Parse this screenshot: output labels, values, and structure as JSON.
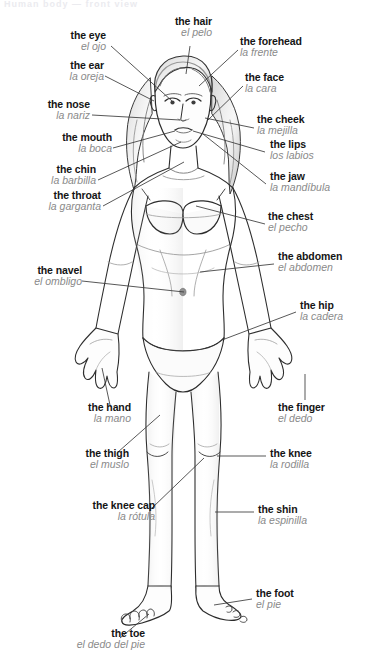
{
  "page": {
    "title_cut": "Human body — front view",
    "background_color": "#ffffff",
    "english_color": "#151515",
    "spanish_color": "#8a8a8a",
    "leader_color": "#3a3a3a"
  },
  "figure": {
    "name": "female-body-front-view",
    "style": "pencil sketch line drawing"
  },
  "labels": [
    {
      "id": "eye",
      "en": "the eye",
      "es": "el ojo",
      "side": "left"
    },
    {
      "id": "hair",
      "en": "the hair",
      "es": "el pelo",
      "side": "left"
    },
    {
      "id": "forehead",
      "en": "the forehead",
      "es": "la frente",
      "side": "right"
    },
    {
      "id": "ear",
      "en": "the ear",
      "es": "la oreja",
      "side": "left"
    },
    {
      "id": "face",
      "en": "the face",
      "es": "la cara",
      "side": "right"
    },
    {
      "id": "nose",
      "en": "the nose",
      "es": "la nariz",
      "side": "left"
    },
    {
      "id": "cheek",
      "en": "the cheek",
      "es": "la mejilla",
      "side": "right"
    },
    {
      "id": "mouth",
      "en": "the mouth",
      "es": "la boca",
      "side": "left"
    },
    {
      "id": "lips",
      "en": "the lips",
      "es": "los labios",
      "side": "right"
    },
    {
      "id": "chin",
      "en": "the chin",
      "es": "la barbilla",
      "side": "left"
    },
    {
      "id": "jaw",
      "en": "the jaw",
      "es": "la mandíbula",
      "side": "right"
    },
    {
      "id": "throat",
      "en": "the throat",
      "es": "la garganta",
      "side": "left"
    },
    {
      "id": "chest",
      "en": "the chest",
      "es": "el pecho",
      "side": "right"
    },
    {
      "id": "navel",
      "en": "the navel",
      "es": "el ombligo",
      "side": "left"
    },
    {
      "id": "abdomen",
      "en": "the abdomen",
      "es": "el abdomen",
      "side": "right"
    },
    {
      "id": "hip",
      "en": "the hip",
      "es": "la cadera",
      "side": "right"
    },
    {
      "id": "hand",
      "en": "the hand",
      "es": "la mano",
      "side": "left"
    },
    {
      "id": "finger",
      "en": "the finger",
      "es": "el dedo",
      "side": "right"
    },
    {
      "id": "thigh",
      "en": "the thigh",
      "es": "el muslo",
      "side": "left"
    },
    {
      "id": "knee",
      "en": "the knee",
      "es": "la rodilla",
      "side": "right"
    },
    {
      "id": "kneecap",
      "en": "the knee cap",
      "es": "la rótula",
      "side": "left"
    },
    {
      "id": "shin",
      "en": "the shin",
      "es": "la espinilla",
      "side": "right"
    },
    {
      "id": "foot",
      "en": "the foot",
      "es": "el pie",
      "side": "right"
    },
    {
      "id": "toe",
      "en": "the toe",
      "es": "el dedo del pie",
      "side": "left"
    }
  ]
}
